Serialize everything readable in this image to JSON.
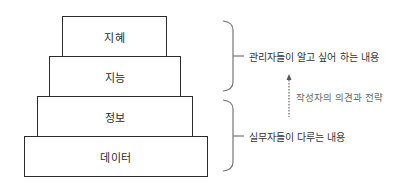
{
  "pyramid": {
    "levels": [
      {
        "label": "지혜"
      },
      {
        "label": "지능"
      },
      {
        "label": "정보"
      },
      {
        "label": "데이터"
      }
    ]
  },
  "annotations": {
    "upper_brace": "관리자들이 알고 싶어 하는 내용",
    "lower_brace": "실무자들이 다루는 내용",
    "arrow_note": "작성자의 의견과 전략"
  },
  "colors": {
    "stroke": "#2b2b2b",
    "brace": "#777777",
    "arrow": "#666666"
  }
}
